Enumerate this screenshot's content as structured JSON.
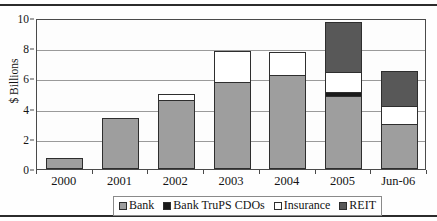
{
  "chart_data": {
    "type": "bar",
    "stacked": true,
    "title": "",
    "xlabel": "",
    "ylabel": "$ Billions",
    "ylim": [
      0,
      10
    ],
    "yticks": [
      0,
      2,
      4,
      6,
      8,
      10
    ],
    "ytick_labels": [
      "0",
      "2",
      "4",
      "6",
      "8",
      "10"
    ],
    "grid": true,
    "grid_axis": "y",
    "legend_position": "bottom",
    "categories": [
      "2000",
      "2001",
      "2002",
      "2003",
      "2004",
      "2005",
      "Jun-06"
    ],
    "series": [
      {
        "name": "Bank",
        "color": "#9e9e9e",
        "values": [
          0.75,
          3.4,
          4.6,
          5.75,
          6.25,
          4.85,
          3.0
        ]
      },
      {
        "name": "Bank TruPS CDOs",
        "color": "#1a1a1a",
        "values": [
          0,
          0,
          0,
          0,
          0,
          0.25,
          0
        ]
      },
      {
        "name": "Insurance",
        "color": "#ffffff",
        "values": [
          0,
          0,
          0.4,
          2.05,
          1.5,
          1.3,
          1.15
        ]
      },
      {
        "name": "REIT",
        "color": "#585858",
        "values": [
          0,
          0,
          0,
          0,
          0,
          3.35,
          2.35
        ]
      }
    ],
    "totals": [
      0.75,
      3.4,
      5.0,
      7.8,
      7.75,
      9.75,
      6.5
    ]
  },
  "legend": {
    "items": [
      {
        "label": "Bank",
        "color": "#9e9e9e"
      },
      {
        "label": "Bank TruPS CDOs",
        "color": "#1a1a1a"
      },
      {
        "label": "Insurance",
        "color": "#ffffff"
      },
      {
        "label": "REIT",
        "color": "#585858"
      }
    ]
  },
  "style": {
    "axis_color": "#4a4a4a",
    "grid_color": "#9a9a9a",
    "bar_edge_color": "#2e2e2e",
    "rule_color": "#2b2b2b",
    "text_color": "#141414",
    "background": "#fefefe"
  }
}
